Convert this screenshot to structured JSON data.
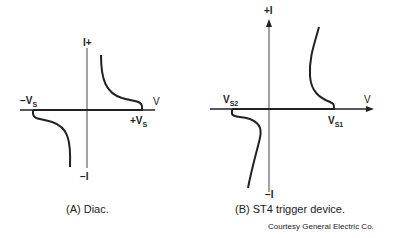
{
  "figure_a": {
    "caption": "(A) Diac.",
    "labels": {
      "y_pos": "I+",
      "y_neg": "−I",
      "x": "V",
      "neg_vs": "−V",
      "neg_vs_sub": "S",
      "pos_vs": "+V",
      "pos_vs_sub": "S"
    }
  },
  "figure_b": {
    "caption": "(B) ST4 trigger device.",
    "labels": {
      "y_pos": "+I",
      "y_neg": "−I",
      "x": "V",
      "vs2": "V",
      "vs2_sub": "S2",
      "vs1": "V",
      "vs1_sub": "S1"
    }
  },
  "credit": "Courtesy General Electric Co.",
  "colors": {
    "ink": "#222222",
    "axis": "#333333",
    "background": "#ffffff"
  }
}
